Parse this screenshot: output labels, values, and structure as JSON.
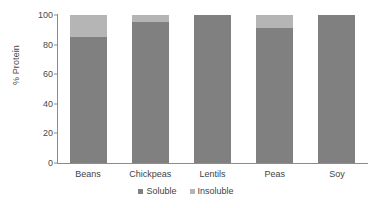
{
  "chart_data": {
    "type": "bar",
    "subtype": "stacked-column",
    "title": "",
    "xlabel": "",
    "ylabel": "% Protein",
    "ylim": [
      0,
      100
    ],
    "yticks": [
      0,
      20,
      40,
      60,
      80,
      100
    ],
    "ytick_labels": [
      "0",
      "20",
      "40",
      "60",
      "80",
      "100"
    ],
    "grid": false,
    "legend_position": "bottom-center",
    "categories": [
      "Beans",
      "Chickpeas",
      "Lentils",
      "Peas",
      "Soy"
    ],
    "series": [
      {
        "name": "Soluble",
        "color": "#808080",
        "values": [
          85,
          95,
          100,
          91,
          100
        ]
      },
      {
        "name": "Insoluble",
        "color": "#b5b5b5",
        "values": [
          15,
          5,
          0,
          9,
          0
        ]
      }
    ]
  },
  "axis": {
    "line_color": "#8c8c8c"
  }
}
